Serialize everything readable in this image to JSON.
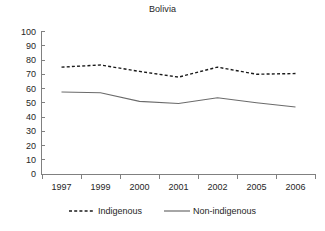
{
  "chart_data": {
    "type": "line",
    "title": "Bolivia",
    "xlabel": "",
    "ylabel": "",
    "categories": [
      "1997",
      "1999",
      "2000",
      "2001",
      "2002",
      "2005",
      "2006"
    ],
    "series": [
      {
        "name": "Indigenous",
        "style": "dashed",
        "color": "#1a1a1a",
        "values": [
          75,
          76.5,
          72,
          68,
          75,
          70,
          70.5
        ]
      },
      {
        "name": "Non-indigenous",
        "style": "solid",
        "color": "#6b6b6b",
        "values": [
          57.5,
          57,
          51,
          49.5,
          53.5,
          50,
          47
        ]
      }
    ],
    "ylim": [
      0,
      100
    ],
    "ytick_step": 10,
    "yticks": [
      "100",
      "90",
      "80",
      "70",
      "60",
      "50",
      "40",
      "30",
      "20",
      "10",
      "0"
    ],
    "grid": false,
    "legend_position": "bottom"
  },
  "legend": {
    "items": [
      {
        "label": "Indigenous",
        "style": "dashed"
      },
      {
        "label": "Non-indigenous",
        "style": "solid"
      }
    ]
  }
}
